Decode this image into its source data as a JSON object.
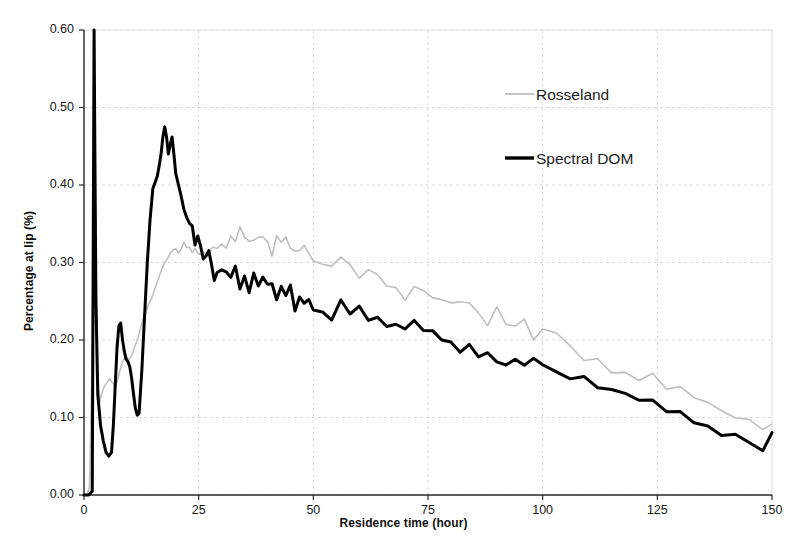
{
  "chart_data": {
    "type": "line",
    "title": "",
    "xlabel": "Residence time (hour)",
    "ylabel": "Percentage at lip (%)",
    "xlim": [
      0,
      150
    ],
    "ylim": [
      0.0,
      0.6
    ],
    "xticks": [
      "0",
      "25",
      "50",
      "75",
      "100",
      "125",
      "150"
    ],
    "xtick_values": [
      0,
      25,
      50,
      75,
      100,
      125,
      150
    ],
    "yticks": [
      "0.00",
      "0.10",
      "0.20",
      "0.30",
      "0.40",
      "0.50",
      "0.60"
    ],
    "ytick_values": [
      0.0,
      0.1,
      0.2,
      0.3,
      0.4,
      0.5,
      0.6
    ],
    "grid": true,
    "grid_color": "#d9d9d9",
    "legend_position": "upper-right-inside",
    "series": [
      {
        "name": "Rosseland",
        "color": "#bfbfbf",
        "width": 1.6,
        "x": [
          0,
          0.6,
          1.2,
          1.8,
          2.2,
          2.6,
          3.0,
          3.4,
          3.8,
          4.4,
          5.0,
          5.6,
          6.2,
          6.8,
          7.4,
          8.0,
          8.6,
          9.2,
          9.8,
          10.4,
          11.0,
          11.6,
          12.2,
          12.8,
          13.4,
          14.0,
          14.6,
          15.2,
          15.8,
          16.4,
          17.0,
          17.6,
          18.2,
          18.8,
          19.4,
          20.0,
          20.6,
          21.2,
          21.8,
          22.4,
          23.0,
          23.6,
          24.2,
          24.8,
          25.4,
          26.0,
          27.0,
          28.0,
          29.0,
          30.0,
          31.0,
          32.0,
          33.0,
          34.0,
          35.0,
          36.0,
          37.0,
          38.0,
          39.0,
          40.0,
          41.0,
          42.0,
          43.0,
          44.0,
          45.0,
          46.0,
          47.0,
          48.0,
          49.0,
          50.0,
          52.0,
          54.0,
          56.0,
          58.0,
          60.0,
          62.0,
          64.0,
          66.0,
          68.0,
          70.0,
          72.0,
          74.0,
          76.0,
          78.0,
          80.0,
          82.0,
          84.0,
          86.0,
          88.0,
          90.0,
          92.0,
          94.0,
          96.0,
          98.0,
          100.0,
          103.0,
          106.0,
          109.0,
          112.0,
          115.0,
          118.0,
          121.0,
          124.0,
          127.0,
          130.0,
          133.0,
          136.0,
          139.0,
          142.0,
          145.0,
          148.0,
          150.0
        ],
        "y": [
          0.0,
          0.0,
          0.01,
          0.18,
          0.47,
          0.3,
          0.16,
          0.12,
          0.13,
          0.14,
          0.145,
          0.15,
          0.145,
          0.14,
          0.15,
          0.165,
          0.175,
          0.178,
          0.175,
          0.18,
          0.19,
          0.2,
          0.212,
          0.225,
          0.235,
          0.245,
          0.252,
          0.262,
          0.272,
          0.282,
          0.292,
          0.3,
          0.305,
          0.312,
          0.316,
          0.318,
          0.312,
          0.318,
          0.326,
          0.322,
          0.316,
          0.322,
          0.328,
          0.318,
          0.312,
          0.318,
          0.312,
          0.322,
          0.316,
          0.328,
          0.318,
          0.332,
          0.325,
          0.338,
          0.328,
          0.336,
          0.326,
          0.332,
          0.322,
          0.33,
          0.318,
          0.326,
          0.316,
          0.325,
          0.312,
          0.318,
          0.308,
          0.316,
          0.305,
          0.312,
          0.302,
          0.295,
          0.3,
          0.288,
          0.282,
          0.29,
          0.278,
          0.272,
          0.268,
          0.262,
          0.27,
          0.258,
          0.252,
          0.256,
          0.246,
          0.24,
          0.248,
          0.236,
          0.228,
          0.234,
          0.222,
          0.216,
          0.222,
          0.21,
          0.205,
          0.198,
          0.19,
          0.182,
          0.176,
          0.168,
          0.162,
          0.155,
          0.148,
          0.14,
          0.134,
          0.126,
          0.118,
          0.112,
          0.105,
          0.098,
          0.09,
          0.082
        ]
      },
      {
        "name": "Spectral DOM",
        "color": "#000000",
        "width": 3.0,
        "x": [
          0,
          1.0,
          1.8,
          2.0,
          2.2,
          2.4,
          2.6,
          3.0,
          3.6,
          4.2,
          4.8,
          5.4,
          6.0,
          6.4,
          6.8,
          7.2,
          7.6,
          8.0,
          8.4,
          8.8,
          9.2,
          9.6,
          10.0,
          10.4,
          10.8,
          11.2,
          11.6,
          12.0,
          12.6,
          13.2,
          13.8,
          14.4,
          15.0,
          15.6,
          16.0,
          16.4,
          16.8,
          17.2,
          17.6,
          18.0,
          18.4,
          18.8,
          19.2,
          19.6,
          20.0,
          20.6,
          21.2,
          21.8,
          22.4,
          23.0,
          23.6,
          24.2,
          24.8,
          25.4,
          26.0,
          26.6,
          27.2,
          27.8,
          28.4,
          29.0,
          30.0,
          31.0,
          32.0,
          33.0,
          34.0,
          35.0,
          36.0,
          37.0,
          38.0,
          39.0,
          40.0,
          41.0,
          42.0,
          43.0,
          44.0,
          45.0,
          46.0,
          47.0,
          48.0,
          49.0,
          50.0,
          52.0,
          54.0,
          56.0,
          58.0,
          60.0,
          62.0,
          64.0,
          66.0,
          68.0,
          70.0,
          72.0,
          74.0,
          76.0,
          78.0,
          80.0,
          82.0,
          84.0,
          86.0,
          88.0,
          90.0,
          92.0,
          94.0,
          96.0,
          98.0,
          100.0,
          103.0,
          106.0,
          109.0,
          112.0,
          115.0,
          118.0,
          121.0,
          124.0,
          127.0,
          130.0,
          133.0,
          136.0,
          139.0,
          142.0,
          145.0,
          148.0,
          150.0
        ],
        "y": [
          0.0,
          0.0,
          0.005,
          0.3,
          0.6,
          0.42,
          0.25,
          0.13,
          0.09,
          0.07,
          0.055,
          0.05,
          0.055,
          0.09,
          0.14,
          0.19,
          0.218,
          0.222,
          0.2,
          0.185,
          0.175,
          0.172,
          0.165,
          0.15,
          0.13,
          0.112,
          0.103,
          0.105,
          0.16,
          0.23,
          0.3,
          0.355,
          0.395,
          0.405,
          0.412,
          0.425,
          0.44,
          0.462,
          0.475,
          0.462,
          0.44,
          0.452,
          0.462,
          0.44,
          0.415,
          0.4,
          0.385,
          0.368,
          0.352,
          0.345,
          0.338,
          0.332,
          0.325,
          0.326,
          0.312,
          0.3,
          0.308,
          0.295,
          0.285,
          0.292,
          0.282,
          0.292,
          0.278,
          0.288,
          0.272,
          0.282,
          0.268,
          0.278,
          0.265,
          0.272,
          0.262,
          0.27,
          0.258,
          0.265,
          0.252,
          0.26,
          0.248,
          0.256,
          0.244,
          0.252,
          0.24,
          0.246,
          0.235,
          0.242,
          0.23,
          0.236,
          0.224,
          0.23,
          0.218,
          0.224,
          0.212,
          0.218,
          0.206,
          0.212,
          0.2,
          0.206,
          0.194,
          0.2,
          0.188,
          0.194,
          0.182,
          0.176,
          0.182,
          0.17,
          0.175,
          0.165,
          0.158,
          0.15,
          0.145,
          0.138,
          0.13,
          0.125,
          0.118,
          0.112,
          0.105,
          0.1,
          0.094,
          0.088,
          0.082,
          0.078,
          0.072,
          0.068,
          0.078
        ]
      }
    ],
    "legend": [
      {
        "label": "Rosseland",
        "color": "#bfbfbf"
      },
      {
        "label": "Spectral DOM",
        "color": "#000000"
      }
    ]
  }
}
